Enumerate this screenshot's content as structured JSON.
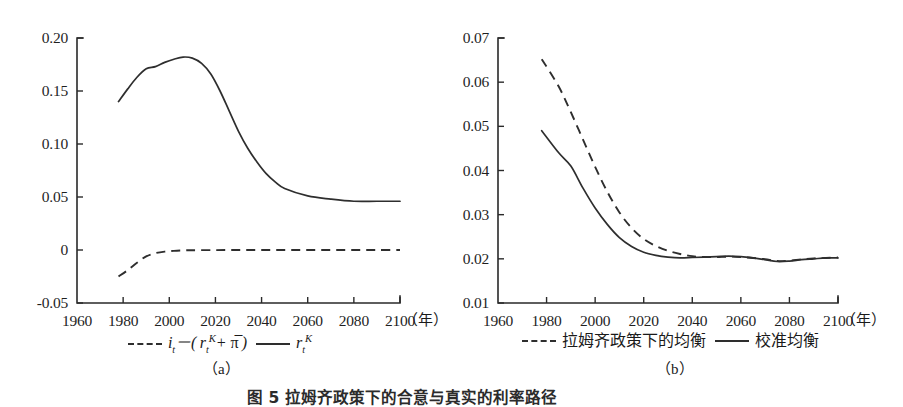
{
  "figure": {
    "caption": "图 5  拉姆齐政策下的合意与真实的利率路径",
    "panel_a_label": "（a）",
    "panel_b_label": "（b）",
    "year_unit": "（年）"
  },
  "chart_data": [
    {
      "type": "line",
      "panel": "a",
      "title": "",
      "xlabel": "（年）",
      "ylabel": "",
      "xlim": [
        1960,
        2100
      ],
      "ylim": [
        -0.05,
        0.2
      ],
      "xticks": [
        1960,
        1980,
        2000,
        2020,
        2040,
        2060,
        2080,
        2100
      ],
      "xticklabels": [
        "1960",
        "1980",
        "2000",
        "2020",
        "2040",
        "2060",
        "2080",
        "2100"
      ],
      "yticks": [
        -0.05,
        0,
        0.05,
        0.1,
        0.15,
        0.2
      ],
      "yticklabels": [
        "-0.05",
        "0",
        "0.05",
        "0.10",
        "0.15",
        "0.20"
      ],
      "grid": false,
      "legend_position": "below",
      "series": [
        {
          "name": "i_t - ( r_t^K + π̄ )",
          "style": "dashed",
          "x": [
            1978,
            1982,
            1986,
            1990,
            1994,
            1998,
            2002,
            2006,
            2010,
            2020,
            2030,
            2040,
            2050,
            2060,
            2070,
            2080,
            2090,
            2100
          ],
          "values": [
            -0.025,
            -0.019,
            -0.012,
            -0.006,
            -0.003,
            -0.0015,
            -0.0008,
            -0.0004,
            -0.0002,
            -0.0001,
            0.0,
            0.0,
            0.0,
            0.0,
            0.0,
            0.0,
            0.0,
            0.0
          ]
        },
        {
          "name": "r_t^K",
          "style": "solid",
          "x": [
            1978,
            1982,
            1986,
            1990,
            1994,
            1998,
            2002,
            2006,
            2010,
            2014,
            2018,
            2022,
            2026,
            2030,
            2034,
            2038,
            2042,
            2046,
            2050,
            2060,
            2070,
            2080,
            2090,
            2100
          ],
          "values": [
            0.14,
            0.152,
            0.163,
            0.171,
            0.173,
            0.177,
            0.18,
            0.182,
            0.181,
            0.176,
            0.166,
            0.15,
            0.131,
            0.112,
            0.096,
            0.083,
            0.072,
            0.064,
            0.058,
            0.051,
            0.048,
            0.046,
            0.046,
            0.046
          ]
        }
      ]
    },
    {
      "type": "line",
      "panel": "b",
      "title": "",
      "xlabel": "（年）",
      "ylabel": "",
      "xlim": [
        1960,
        2100
      ],
      "ylim": [
        0.01,
        0.07
      ],
      "xticks": [
        1960,
        1980,
        2000,
        2020,
        2040,
        2060,
        2080,
        2100
      ],
      "xticklabels": [
        "1960",
        "1980",
        "2000",
        "2020",
        "2040",
        "2060",
        "2080",
        "2100"
      ],
      "yticks": [
        0.01,
        0.02,
        0.03,
        0.04,
        0.05,
        0.06,
        0.07
      ],
      "yticklabels": [
        "0.01",
        "0.02",
        "0.03",
        "0.04",
        "0.05",
        "0.06",
        "0.07"
      ],
      "grid": false,
      "legend_position": "below",
      "series": [
        {
          "name": "拉姆齐政策下的均衡",
          "style": "dashed",
          "x": [
            1978,
            1985,
            1990,
            1995,
            2000,
            2005,
            2010,
            2015,
            2020,
            2025,
            2030,
            2035,
            2040,
            2045,
            2050,
            2055,
            2060,
            2065,
            2070,
            2075,
            2080,
            2085,
            2090,
            2095,
            2100
          ],
          "values": [
            0.0652,
            0.059,
            0.0532,
            0.047,
            0.0408,
            0.0352,
            0.0305,
            0.027,
            0.0245,
            0.0229,
            0.0218,
            0.0211,
            0.0206,
            0.0204,
            0.0204,
            0.0205,
            0.0204,
            0.0202,
            0.0199,
            0.0195,
            0.0196,
            0.0199,
            0.0201,
            0.0202,
            0.0203
          ]
        },
        {
          "name": "校准均衡",
          "style": "solid",
          "x": [
            1978,
            1985,
            1990,
            1995,
            2000,
            2005,
            2010,
            2015,
            2020,
            2025,
            2030,
            2035,
            2040,
            2045,
            2050,
            2055,
            2060,
            2065,
            2070,
            2075,
            2080,
            2085,
            2090,
            2095,
            2100
          ],
          "values": [
            0.049,
            0.044,
            0.041,
            0.036,
            0.0315,
            0.0278,
            0.0248,
            0.0228,
            0.0215,
            0.0208,
            0.0204,
            0.0202,
            0.0203,
            0.0204,
            0.0205,
            0.0206,
            0.0205,
            0.0202,
            0.0198,
            0.0194,
            0.0195,
            0.0198,
            0.02,
            0.0202,
            0.0202
          ]
        }
      ]
    }
  ],
  "panel_a": {
    "yticklabels": [
      "0.20",
      "0.15",
      "0.10",
      "0.05",
      "0",
      "-0.05"
    ],
    "xticklabels": [
      "1960",
      "1980",
      "2000",
      "2020",
      "2040",
      "2060",
      "2080",
      "2100"
    ],
    "unit": "（年）",
    "legend": {
      "dashed_label": "i_t－( r_t^K + π̄ )",
      "solid_label": "r_t^K"
    },
    "sublabel": "（a）"
  },
  "panel_b": {
    "yticklabels": [
      "0.07",
      "0.06",
      "0.05",
      "0.04",
      "0.03",
      "0.02",
      "0.01"
    ],
    "xticklabels": [
      "1960",
      "1980",
      "2000",
      "2020",
      "2040",
      "2060",
      "2080",
      "2100"
    ],
    "unit": "（年）",
    "legend": {
      "dashed_label": "拉姆齐政策下的均衡",
      "solid_label": "校准均衡"
    },
    "sublabel": "（b）"
  },
  "colors": {
    "line": "#2e2e2e",
    "axis": "#2a2a2a",
    "text": "#1a1a1a",
    "background": "#ffffff"
  }
}
